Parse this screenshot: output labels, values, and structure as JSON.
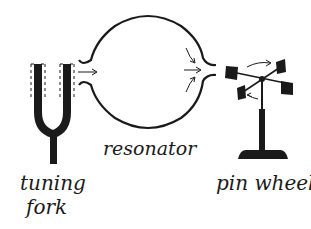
{
  "diagram": {
    "type": "physics-illustration",
    "components": [
      {
        "id": "tuning-fork",
        "label_lines": [
          "tuning",
          "fork"
        ]
      },
      {
        "id": "resonator",
        "label": "resonator"
      },
      {
        "id": "pin-wheel",
        "label": "pin wheel"
      }
    ],
    "flow": [
      "tuning fork",
      "resonator",
      "pin wheel"
    ],
    "arrows": [
      {
        "from": "tuning fork",
        "to": "resonator inlet",
        "meaning": "sound waves enter"
      },
      {
        "from": "resonator interior",
        "to": "resonator outlet",
        "meaning": "air converges toward outlet"
      },
      {
        "on": "pin wheel",
        "meaning": "rotation of vanes"
      }
    ],
    "colors": {
      "ink": "#1a1a1a",
      "background": "#ffffff"
    }
  },
  "labels": {
    "tuning": "tuning",
    "fork": "fork",
    "resonator": "resonator",
    "pin_wheel": "pin wheel"
  }
}
